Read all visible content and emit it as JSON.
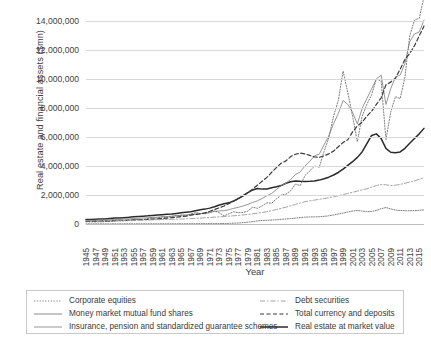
{
  "chart_data": {
    "type": "line",
    "title": "",
    "xlabel": "Year",
    "ylabel": "Real estate and financial assets ($mn)",
    "ylim": [
      0,
      14000000
    ],
    "yticks": [
      "0",
      "2,000,000",
      "4,000,000",
      "6,000,000",
      "8,000,000",
      "10,000,000",
      "12,000,000",
      "14,000,000"
    ],
    "ytick_values": [
      0,
      2000000,
      4000000,
      6000000,
      8000000,
      10000000,
      12000000,
      14000000
    ],
    "grid": true,
    "legend_position": "bottom",
    "x_start": 1945,
    "x_end": 2016,
    "xticks": [
      "1945",
      "1947",
      "1949",
      "1951",
      "1953",
      "1955",
      "1957",
      "1959",
      "1961",
      "1963",
      "1965",
      "1967",
      "1969",
      "1971",
      "1973",
      "1975",
      "1977",
      "1979",
      "1981",
      "1983",
      "1985",
      "1987",
      "1989",
      "1991",
      "1993",
      "1995",
      "1997",
      "1999",
      "2001",
      "2003",
      "2005",
      "2007",
      "2009",
      "2011",
      "2013",
      "2015"
    ],
    "x": [
      1945,
      1946,
      1947,
      1948,
      1949,
      1950,
      1951,
      1952,
      1953,
      1954,
      1955,
      1956,
      1957,
      1958,
      1959,
      1960,
      1961,
      1962,
      1963,
      1964,
      1965,
      1966,
      1967,
      1968,
      1969,
      1970,
      1971,
      1972,
      1973,
      1974,
      1975,
      1976,
      1977,
      1978,
      1979,
      1980,
      1981,
      1982,
      1983,
      1984,
      1985,
      1986,
      1987,
      1988,
      1989,
      1990,
      1991,
      1992,
      1993,
      1994,
      1995,
      1996,
      1997,
      1998,
      1999,
      2000,
      2001,
      2002,
      2003,
      2004,
      2005,
      2006,
      2007,
      2008,
      2009,
      2010,
      2011,
      2012,
      2013,
      2014,
      2015,
      2016
    ],
    "series": [
      {
        "name": "Real estate at market value",
        "style": "solid-thick",
        "color": "#2a2a2a",
        "values": [
          1150000,
          1180000,
          1230000,
          1280000,
          1300000,
          1400000,
          1500000,
          1560000,
          1620000,
          1700000,
          1820000,
          1920000,
          2000000,
          2080000,
          2200000,
          2280000,
          2360000,
          2460000,
          2560000,
          2700000,
          2850000,
          3000000,
          3150000,
          3400000,
          3650000,
          3800000,
          4050000,
          4400000,
          4850000,
          5150000,
          5400000,
          5850000,
          6500000,
          7200000,
          8000000,
          8700000,
          9050000,
          8900000,
          8950000,
          9250000,
          9500000,
          9800000,
          10400000,
          10800000,
          11000000,
          10900000,
          10850000,
          10900000,
          11000000,
          11200000,
          11550000,
          11950000,
          12500000,
          13150000,
          14000000,
          14950000,
          15900000,
          17000000,
          18400000,
          20500000,
          22600000,
          23000000,
          21800000,
          19300000,
          18300000,
          18200000,
          18400000,
          19300000,
          20600000,
          21800000,
          23000000,
          24400000
        ]
      },
      {
        "name": "Insurance, pension and standardized guarantee schemes",
        "style": "solid-thin",
        "color": "#8a8a8a",
        "values": [
          900000,
          930000,
          960000,
          1000000,
          1040000,
          1090000,
          1140000,
          1200000,
          1250000,
          1320000,
          1390000,
          1450000,
          1510000,
          1600000,
          1680000,
          1750000,
          1840000,
          1910000,
          2000000,
          2100000,
          2200000,
          2280000,
          2420000,
          2560000,
          2650000,
          2780000,
          2980000,
          3200000,
          3350000,
          3400000,
          3650000,
          3980000,
          4250000,
          4600000,
          5000000,
          5500000,
          5900000,
          6500000,
          7200000,
          7800000,
          8800000,
          9800000,
          10400000,
          11400000,
          12600000,
          13300000,
          14800000,
          16000000,
          17400000,
          17800000,
          20200000,
          22500000,
          25600000,
          28200000,
          31500000,
          30500000,
          28500000,
          25500000,
          29500000,
          32000000,
          34500000,
          37000000,
          38000000,
          30500000,
          34500000,
          37500000,
          38000000,
          41000000,
          46500000,
          48500000,
          49000000,
          52000000
        ]
      },
      {
        "name": "Corporate equities",
        "style": "dotted",
        "color": "#6e6e6e",
        "values": [
          550000,
          560000,
          540000,
          560000,
          600000,
          680000,
          740000,
          800000,
          790000,
          980000,
          1100000,
          1160000,
          1060000,
          1400000,
          1520000,
          1530000,
          1820000,
          1680000,
          1920000,
          2150000,
          2300000,
          2180000,
          2550000,
          2900000,
          2700000,
          2600000,
          2900000,
          3350000,
          2900000,
          2050000,
          2600000,
          3100000,
          2900000,
          2950000,
          3300000,
          4300000,
          4000000,
          4600000,
          5400000,
          5300000,
          6400000,
          7400000,
          7600000,
          8500000,
          10200000,
          9800000,
          12400000,
          13500000,
          14800000,
          14500000,
          18500000,
          22000000,
          27500000,
          31500000,
          39000000,
          33500000,
          27500000,
          21000000,
          27500000,
          30500000,
          33000000,
          37000000,
          36500000,
          21500000,
          28500000,
          32500000,
          32000000,
          37500000,
          48000000,
          52000000,
          52500000,
          58000000
        ]
      },
      {
        "name": "Total currency and deposits",
        "style": "dashed",
        "color": "#3a3a3a",
        "values": [
          700000,
          720000,
          750000,
          770000,
          790000,
          820000,
          860000,
          910000,
          950000,
          1000000,
          1040000,
          1080000,
          1130000,
          1200000,
          1250000,
          1300000,
          1400000,
          1500000,
          1620000,
          1750000,
          1900000,
          2020000,
          2250000,
          2450000,
          2550000,
          2850000,
          3250000,
          3700000,
          4150000,
          4600000,
          5200000,
          5800000,
          6500000,
          7300000,
          8000000,
          8900000,
          9900000,
          10900000,
          11900000,
          13200000,
          14400000,
          15500000,
          16100000,
          17200000,
          17800000,
          18100000,
          17900000,
          17500000,
          17100000,
          17000000,
          17400000,
          17900000,
          18600000,
          19700000,
          20800000,
          21500000,
          23500000,
          25000000,
          26000000,
          27500000,
          28800000,
          30500000,
          32200000,
          35500000,
          36200000,
          37200000,
          39500000,
          42000000,
          43500000,
          45500000,
          48000000,
          50500000
        ]
      },
      {
        "name": "Debt securities",
        "style": "dash-dot",
        "color": "#9a9a9a",
        "values": [
          820000,
          830000,
          840000,
          850000,
          860000,
          870000,
          890000,
          910000,
          930000,
          950000,
          970000,
          990000,
          1010000,
          1030000,
          1060000,
          1090000,
          1120000,
          1150000,
          1190000,
          1230000,
          1270000,
          1320000,
          1380000,
          1440000,
          1500000,
          1580000,
          1660000,
          1740000,
          1820000,
          1900000,
          2000000,
          2100000,
          2200000,
          2320000,
          2450000,
          2600000,
          2780000,
          2950000,
          3150000,
          3400000,
          3700000,
          4000000,
          4300000,
          4650000,
          5000000,
          5350000,
          5700000,
          5900000,
          6100000,
          6300000,
          6500000,
          6700000,
          6950000,
          7200000,
          7500000,
          7800000,
          8100000,
          8400000,
          8700000,
          9000000,
          9400000,
          9800000,
          10100000,
          10000000,
          9800000,
          9900000,
          10100000,
          10400000,
          10700000,
          11000000,
          11400000,
          11800000
        ]
      },
      {
        "name": "Money market mutual fund shares",
        "style": "dotted-thick",
        "color": "#7d7d7d",
        "values": [
          30000,
          31000,
          32000,
          33000,
          34000,
          35000,
          36000,
          37000,
          38000,
          40000,
          42000,
          44000,
          46000,
          48000,
          50000,
          52000,
          55000,
          58000,
          61000,
          64000,
          68000,
          72000,
          76000,
          80000,
          85000,
          90000,
          95000,
          100000,
          110000,
          130000,
          170000,
          210000,
          260000,
          340000,
          450000,
          600000,
          780000,
          900000,
          950000,
          1000000,
          1080000,
          1180000,
          1280000,
          1380000,
          1500000,
          1650000,
          1750000,
          1800000,
          1820000,
          1850000,
          1950000,
          2100000,
          2300000,
          2550000,
          2800000,
          3050000,
          3300000,
          3450000,
          3300000,
          3150000,
          3200000,
          3450000,
          3900000,
          4200000,
          3850000,
          3550000,
          3450000,
          3400000,
          3380000,
          3400000,
          3500000,
          3600000
        ]
      }
    ]
  },
  "legend": {
    "left": [
      {
        "label": "Corporate equities",
        "key": "dotted"
      },
      {
        "label": "Money market mutual fund shares",
        "key": "solid-thin"
      },
      {
        "label": "Insurance, pension and standardized guarantee schemes",
        "key": "solid-thin"
      }
    ],
    "right": [
      {
        "label": "Debt securities",
        "key": "dash-dot"
      },
      {
        "label": "Total currency and deposits",
        "key": "dashed"
      },
      {
        "label": "Real estate at market value",
        "key": "solid-thick"
      }
    ]
  }
}
